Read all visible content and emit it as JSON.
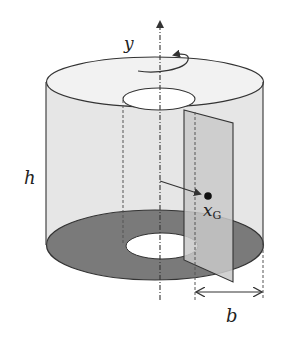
{
  "diagram": {
    "labels": {
      "axis": "y",
      "height": "h",
      "centroid": "x",
      "centroid_sub": "G",
      "width": "b"
    },
    "colors": {
      "stroke": "#333333",
      "side_fill": "#e6e6e6",
      "top_fill": "#f0f0f0",
      "base_fill": "#7a7a7a",
      "slice_fill": "#c4c4c4",
      "hole_fill": "#ffffff"
    }
  }
}
